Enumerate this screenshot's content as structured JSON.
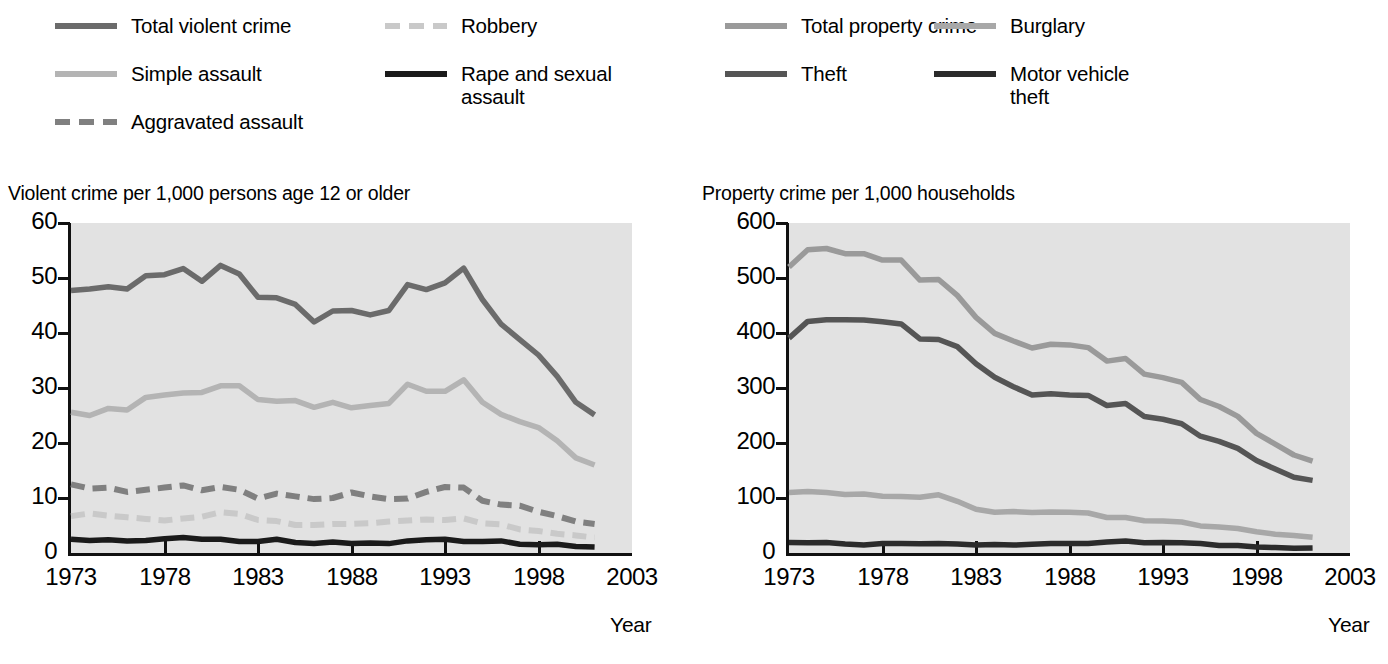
{
  "figure": {
    "background": "#ffffff",
    "plot_background": "#e2e2e2",
    "axis_color": "#111111"
  },
  "panels": [
    {
      "id": "violent",
      "title": "Violent crime per 1,000 persons age 12 or older",
      "xlabel": "Year",
      "legend": [
        {
          "label": "Total violent crime",
          "color": "#6b6b6b",
          "style": "solid",
          "col": 0,
          "row": 0
        },
        {
          "label": "Robbery",
          "color": "#c9c9c9",
          "style": "dashed",
          "col": 1,
          "row": 0
        },
        {
          "label": "Simple assault",
          "color": "#b4b4b4",
          "style": "solid",
          "col": 0,
          "row": 1
        },
        {
          "label": "Rape and sexual\nassault",
          "color": "#1a1a1a",
          "style": "solid",
          "col": 1,
          "row": 1
        },
        {
          "label": "Aggravated assault",
          "color": "#808080",
          "style": "dashed",
          "col": 0,
          "row": 2
        }
      ]
    },
    {
      "id": "property",
      "title": "Property crime per 1,000 households",
      "xlabel": "Year",
      "legend": [
        {
          "label": "Total property crime",
          "color": "#9a9a9a",
          "style": "solid",
          "col": 0,
          "row": 0
        },
        {
          "label": "Burglary",
          "color": "#a8a8a8",
          "style": "solid",
          "col": 1,
          "row": 0
        },
        {
          "label": "Theft",
          "color": "#555555",
          "style": "solid",
          "col": 0,
          "row": 1
        },
        {
          "label": "Motor vehicle\ntheft",
          "color": "#2b2b2b",
          "style": "solid",
          "col": 1,
          "row": 1
        }
      ]
    }
  ],
  "chart_data": [
    {
      "type": "line",
      "title": "Violent crime per 1,000 persons age 12 or older",
      "xlabel": "Year",
      "ylabel": "Violent crime per 1,000 persons age 12 or older",
      "xlim": [
        1973,
        2003
      ],
      "ylim": [
        0,
        60
      ],
      "xticks": [
        1973,
        1978,
        1983,
        1988,
        1993,
        1998,
        2003
      ],
      "yticks": [
        0,
        10,
        20,
        30,
        40,
        50,
        60
      ],
      "grid": false,
      "legend_position": "above-left",
      "x": [
        1973,
        1974,
        1975,
        1976,
        1977,
        1978,
        1979,
        1980,
        1981,
        1982,
        1983,
        1984,
        1985,
        1986,
        1987,
        1988,
        1989,
        1990,
        1991,
        1992,
        1993,
        1994,
        1995,
        1996,
        1997,
        1998,
        1999,
        2000,
        2001
      ],
      "series": [
        {
          "name": "Total violent crime",
          "color": "#6b6b6b",
          "style": "solid",
          "values": [
            47.7,
            48.0,
            48.4,
            48.0,
            50.4,
            50.6,
            51.7,
            49.4,
            52.3,
            50.7,
            46.5,
            46.4,
            45.2,
            42.0,
            44.0,
            44.1,
            43.3,
            44.1,
            48.8,
            47.9,
            49.1,
            51.8,
            46.1,
            41.6,
            38.8,
            36.0,
            32.1,
            27.4,
            25.1
          ]
        },
        {
          "name": "Simple assault",
          "color": "#b4b4b4",
          "style": "solid",
          "values": [
            25.6,
            25.0,
            26.3,
            26.0,
            28.3,
            28.7,
            29.1,
            29.2,
            30.4,
            30.4,
            27.9,
            27.6,
            27.7,
            26.5,
            27.4,
            26.4,
            26.8,
            27.2,
            30.7,
            29.4,
            29.4,
            31.5,
            27.4,
            25.2,
            23.9,
            22.8,
            20.4,
            17.3,
            16.0
          ]
        },
        {
          "name": "Aggravated assault",
          "color": "#808080",
          "style": "dashed",
          "values": [
            12.5,
            11.7,
            11.9,
            11.1,
            11.5,
            11.9,
            12.3,
            11.4,
            12.0,
            11.5,
            9.9,
            10.8,
            10.3,
            9.8,
            10.0,
            11.0,
            10.3,
            9.8,
            9.9,
            11.1,
            12.0,
            11.9,
            9.5,
            8.8,
            8.6,
            7.5,
            6.7,
            5.7,
            5.3
          ]
        },
        {
          "name": "Robbery",
          "color": "#c9c9c9",
          "style": "dashed",
          "values": [
            6.7,
            7.2,
            6.8,
            6.5,
            6.2,
            5.9,
            6.3,
            6.6,
            7.4,
            7.1,
            6.0,
            5.8,
            5.1,
            5.1,
            5.3,
            5.3,
            5.4,
            5.7,
            5.9,
            6.1,
            6.0,
            6.3,
            5.4,
            5.2,
            4.3,
            4.0,
            3.5,
            3.2,
            2.8
          ]
        },
        {
          "name": "Rape and sexual assault",
          "color": "#1a1a1a",
          "style": "solid",
          "values": [
            2.5,
            2.3,
            2.4,
            2.2,
            2.3,
            2.6,
            2.8,
            2.5,
            2.5,
            2.1,
            2.1,
            2.5,
            1.9,
            1.7,
            2.0,
            1.7,
            1.8,
            1.7,
            2.2,
            2.4,
            2.5,
            2.1,
            2.1,
            2.2,
            1.6,
            1.5,
            1.6,
            1.2,
            1.1
          ]
        }
      ]
    },
    {
      "type": "line",
      "title": "Property crime per 1,000 households",
      "xlabel": "Year",
      "ylabel": "Property crime per 1,000 households",
      "xlim": [
        1973,
        2003
      ],
      "ylim": [
        0,
        600
      ],
      "xticks": [
        1973,
        1978,
        1983,
        1988,
        1993,
        1998,
        2003
      ],
      "yticks": [
        0,
        100,
        200,
        300,
        400,
        500,
        600
      ],
      "grid": false,
      "legend_position": "above-right",
      "x": [
        1973,
        1974,
        1975,
        1976,
        1977,
        1978,
        1979,
        1980,
        1981,
        1982,
        1983,
        1984,
        1985,
        1986,
        1987,
        1988,
        1989,
        1990,
        1991,
        1992,
        1993,
        1994,
        1995,
        1996,
        1997,
        1998,
        1999,
        2000,
        2001
      ],
      "series": [
        {
          "name": "Total property crime",
          "color": "#9a9a9a",
          "style": "solid",
          "values": [
            519.9,
            551.5,
            553.6,
            544.2,
            544.1,
            532.6,
            532.6,
            496.1,
            497.2,
            468.3,
            428.4,
            399.2,
            385.4,
            372.7,
            379.6,
            378.4,
            373.4,
            348.9,
            353.7,
            325.3,
            318.9,
            310.2,
            279.0,
            266.3,
            248.3,
            217.4,
            198.0,
            178.1,
            166.9
          ]
        },
        {
          "name": "Theft",
          "color": "#555555",
          "style": "solid",
          "values": [
            390.8,
            421.0,
            424.1,
            424.1,
            423.7,
            420.5,
            416.6,
            389.3,
            388.1,
            375.2,
            344.1,
            319.5,
            302.4,
            287.1,
            289.6,
            287.2,
            286.5,
            268.2,
            271.9,
            248.2,
            243.1,
            235.1,
            212.4,
            202.9,
            190.2,
            168.1,
            152.5,
            137.7,
            132.0
          ]
        },
        {
          "name": "Burglary",
          "color": "#a8a8a8",
          "style": "solid",
          "values": [
            110.0,
            111.8,
            110.2,
            106.6,
            107.0,
            103.1,
            102.8,
            101.4,
            105.9,
            94.0,
            79.5,
            74.0,
            75.2,
            73.8,
            74.5,
            74.2,
            72.7,
            64.5,
            64.6,
            58.6,
            58.2,
            56.3,
            49.3,
            47.2,
            44.6,
            38.5,
            34.1,
            31.8,
            28.7
          ]
        },
        {
          "name": "Motor vehicle theft",
          "color": "#2b2b2b",
          "style": "solid",
          "values": [
            19.1,
            18.8,
            19.3,
            16.5,
            14.8,
            17.5,
            17.5,
            16.7,
            17.1,
            16.2,
            14.6,
            15.2,
            14.4,
            15.9,
            17.5,
            17.5,
            17.1,
            20.0,
            21.8,
            18.5,
            19.0,
            18.8,
            17.1,
            13.5,
            13.8,
            10.8,
            10.0,
            8.6,
            9.0
          ]
        }
      ]
    }
  ]
}
